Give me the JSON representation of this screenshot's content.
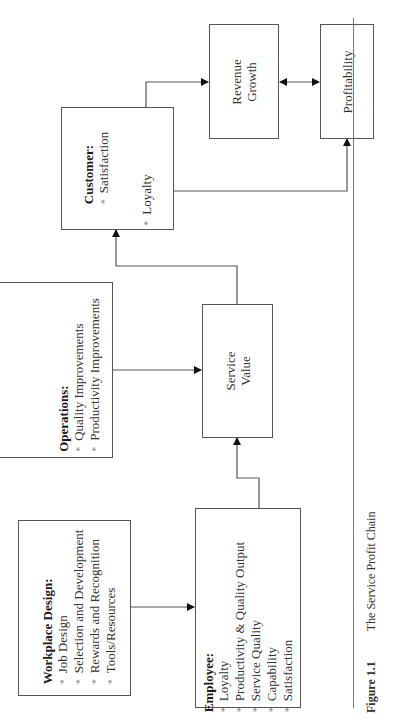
{
  "figure": {
    "number": "Figure 1.1",
    "title": "The Service Profit Chain"
  },
  "nodes": {
    "workplace": {
      "title": "Workplace Design:",
      "items": [
        "Job Design",
        "Selection and Development",
        "Rewards and Recognition",
        "Tools/Resources"
      ]
    },
    "employee": {
      "title": "Employee:",
      "items": [
        "Loyalty",
        "Productivity & Quality Output",
        "Service Quality",
        "Capability",
        "Satisfaction"
      ]
    },
    "operations": {
      "title": "Operations:",
      "items": [
        "Quality Improvements",
        "Productivity Improvements"
      ]
    },
    "service_value": {
      "line1": "Service",
      "line2": "Value"
    },
    "customer": {
      "title": "Customer:",
      "item1": "Satisfaction",
      "item2": "Loyalty"
    },
    "revenue": {
      "line1": "Revenue",
      "line2": "Growth"
    },
    "profitability": {
      "label": "Profitability"
    }
  },
  "bullet": "*",
  "colors": {
    "line": "#555555",
    "arrow": "#111111",
    "text": "#333333"
  }
}
